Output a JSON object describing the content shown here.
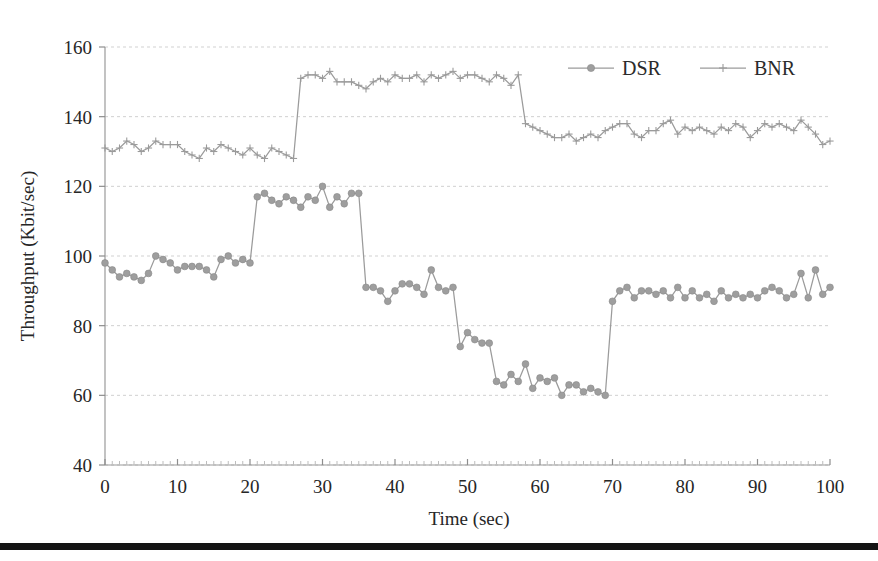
{
  "figure": {
    "background": "#ffffff",
    "rule_color": "#141414",
    "series_color": "#9b9b9b"
  },
  "legend": {
    "position": "top-right",
    "entries": [
      {
        "label": "DSR",
        "marker": "filled-circle-marker",
        "color": "#9e9e9e"
      },
      {
        "label": "BNR",
        "marker": "plus-cross-marker",
        "color": "#9b9b9b"
      }
    ]
  },
  "chart_data": {
    "type": "line",
    "title": "",
    "xlabel": "Time (sec)",
    "ylabel": "Throughput (Kbit/sec)",
    "xlim": [
      0,
      100
    ],
    "ylim": [
      40,
      160
    ],
    "xticks": [
      0,
      10,
      20,
      30,
      40,
      50,
      60,
      70,
      80,
      90,
      100
    ],
    "yticks": [
      40,
      60,
      80,
      100,
      120,
      140,
      160
    ],
    "grid": "horizontal-dashed",
    "minor_xticks_step": 1,
    "x": [
      0,
      1,
      2,
      3,
      4,
      5,
      6,
      7,
      8,
      9,
      10,
      11,
      12,
      13,
      14,
      15,
      16,
      17,
      18,
      19,
      20,
      21,
      22,
      23,
      24,
      25,
      26,
      27,
      28,
      29,
      30,
      31,
      32,
      33,
      34,
      35,
      36,
      37,
      38,
      39,
      40,
      41,
      42,
      43,
      44,
      45,
      46,
      47,
      48,
      49,
      50,
      51,
      52,
      53,
      54,
      55,
      56,
      57,
      58,
      59,
      60,
      61,
      62,
      63,
      64,
      65,
      66,
      67,
      68,
      69,
      70,
      71,
      72,
      73,
      74,
      75,
      76,
      77,
      78,
      79,
      80,
      81,
      82,
      83,
      84,
      85,
      86,
      87,
      88,
      89,
      90,
      91,
      92,
      93,
      94,
      95,
      96,
      97,
      98,
      99,
      100
    ],
    "series": [
      {
        "name": "DSR",
        "marker": "filled-circle-marker",
        "values": [
          98,
          96,
          94,
          95,
          94,
          93,
          95,
          100,
          99,
          98,
          96,
          97,
          97,
          97,
          96,
          94,
          99,
          100,
          98,
          99,
          98,
          117,
          118,
          116,
          115,
          117,
          116,
          114,
          117,
          116,
          120,
          114,
          117,
          115,
          118,
          118,
          91,
          91,
          90,
          87,
          90,
          92,
          92,
          91,
          89,
          96,
          91,
          90,
          91,
          74,
          78,
          76,
          75,
          75,
          64,
          63,
          66,
          64,
          69,
          62,
          65,
          64,
          65,
          60,
          63,
          63,
          61,
          62,
          61,
          60,
          87,
          90,
          91,
          88,
          90,
          90,
          89,
          90,
          88,
          91,
          88,
          90,
          88,
          89,
          87,
          90,
          88,
          89,
          88,
          89,
          88,
          90,
          91,
          90,
          88,
          89,
          95,
          88,
          96,
          89,
          91
        ]
      },
      {
        "name": "BNR",
        "marker": "plus-cross-marker",
        "values": [
          131,
          130,
          131,
          133,
          132,
          130,
          131,
          133,
          132,
          132,
          132,
          130,
          129,
          128,
          131,
          130,
          132,
          131,
          130,
          129,
          131,
          129,
          128,
          131,
          130,
          129,
          128,
          151,
          152,
          152,
          151,
          153,
          150,
          150,
          150,
          149,
          148,
          150,
          151,
          150,
          152,
          151,
          151,
          152,
          150,
          152,
          151,
          152,
          153,
          151,
          152,
          152,
          151,
          150,
          152,
          151,
          149,
          152,
          138,
          137,
          136,
          135,
          134,
          134,
          135,
          133,
          134,
          135,
          134,
          136,
          137,
          138,
          138,
          135,
          134,
          136,
          136,
          138,
          139,
          135,
          137,
          136,
          137,
          136,
          135,
          137,
          136,
          138,
          137,
          134,
          136,
          138,
          137,
          138,
          137,
          136,
          139,
          137,
          135,
          132,
          133
        ]
      }
    ],
    "series_bnr_note": "BNR rises at ~15s and drops at ~37s",
    "annotations": []
  }
}
